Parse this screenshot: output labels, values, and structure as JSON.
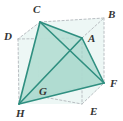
{
  "figure": {
    "colors": {
      "solid_edge": "#2f8f80",
      "dashed_edge": "#b9bec2",
      "face_fill_light": "#c9e7df",
      "face_fill_mid": "#b5ded4",
      "face_fill_dark": "#a4d6cb",
      "label_text": "#333333",
      "background": "#ffffff"
    },
    "vertices": [
      {
        "id": "C",
        "label": "C",
        "x": 40,
        "y": 22,
        "label_x": 33,
        "label_y": 4
      },
      {
        "id": "B",
        "label": "B",
        "x": 104,
        "y": 18,
        "label_x": 108,
        "label_y": 9
      },
      {
        "id": "D",
        "label": "D",
        "x": 18,
        "y": 39,
        "label_x": 4,
        "label_y": 31
      },
      {
        "id": "A",
        "label": "A",
        "x": 82,
        "y": 38,
        "label_x": 88,
        "label_y": 33
      },
      {
        "id": "F",
        "label": "F",
        "x": 104,
        "y": 83,
        "label_x": 110,
        "label_y": 78
      },
      {
        "id": "G",
        "label": "G",
        "x": 38,
        "y": 96,
        "label_x": 39,
        "label_y": 86
      },
      {
        "id": "E",
        "label": "E",
        "x": 82,
        "y": 104,
        "label_x": 90,
        "label_y": 106
      },
      {
        "id": "H",
        "label": "H",
        "x": 19,
        "y": 104,
        "label_x": 16,
        "label_y": 108
      }
    ],
    "solid_edges": [
      {
        "name": "edge-C-A",
        "from": "C",
        "to": "A"
      },
      {
        "name": "edge-C-H",
        "from": "C",
        "to": "H"
      },
      {
        "name": "edge-C-F",
        "from": "C",
        "to": "F"
      },
      {
        "name": "edge-A-H",
        "from": "A",
        "to": "H"
      },
      {
        "name": "edge-A-F",
        "from": "A",
        "to": "F"
      },
      {
        "name": "edge-H-F",
        "from": "H",
        "to": "F"
      }
    ],
    "dashed_edges": [
      {
        "name": "cube-edge-C-B",
        "from": "C",
        "to": "B"
      },
      {
        "name": "cube-edge-C-D",
        "from": "C",
        "to": "D"
      },
      {
        "name": "cube-edge-D-A",
        "from": "D",
        "to": "A"
      },
      {
        "name": "cube-edge-A-B",
        "from": "A",
        "to": "B"
      },
      {
        "name": "cube-edge-B-F",
        "from": "B",
        "to": "F"
      },
      {
        "name": "cube-edge-D-H",
        "from": "D",
        "to": "H"
      },
      {
        "name": "cube-edge-A-E",
        "from": "A",
        "to": "E"
      },
      {
        "name": "cube-edge-H-G",
        "from": "H",
        "to": "G"
      },
      {
        "name": "cube-edge-G-E",
        "from": "G",
        "to": "E"
      },
      {
        "name": "cube-edge-G-F",
        "from": "G",
        "to": "F"
      },
      {
        "name": "cube-edge-E-F",
        "from": "E",
        "to": "F"
      },
      {
        "name": "cube-edge-C-G",
        "from": "C",
        "to": "G"
      }
    ],
    "faces": [
      {
        "name": "face-C-A-H",
        "points": "40,22 82,38 19,104",
        "fill": "#b5ded4",
        "opacity": 0.85
      },
      {
        "name": "face-C-H-F",
        "points": "40,22 19,104 104,83",
        "fill": "#c9e7df",
        "opacity": 0.8
      },
      {
        "name": "face-A-H-F",
        "points": "82,38 19,104 104,83",
        "fill": "#a4d6cb",
        "opacity": 0.72
      }
    ]
  }
}
